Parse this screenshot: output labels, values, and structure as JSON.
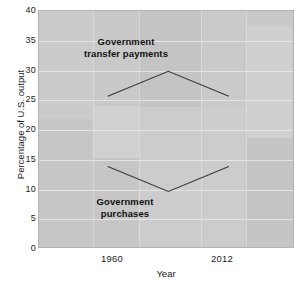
{
  "chart_data": {
    "type": "line",
    "title": "",
    "xlabel": "Year",
    "ylabel": "Percentage of U.S. output",
    "xlim": [
      1930,
      2040
    ],
    "ylim": [
      0,
      40
    ],
    "ytick_labels": [
      "0",
      "5",
      "10",
      "15",
      "20",
      "25",
      "30",
      "35",
      "40"
    ],
    "ytick_values": [
      0,
      5,
      10,
      15,
      20,
      25,
      30,
      35,
      40
    ],
    "xtick_labels": [
      "1960",
      "2012"
    ],
    "xtick_values": [
      1960,
      2012
    ],
    "grid": "horizontal",
    "legend": "none",
    "series": [
      {
        "name": "Government transfer payments",
        "x": [
          1960,
          1986,
          2012
        ],
        "values": [
          25.5,
          29.7,
          25.5
        ],
        "color": "#3a3a3a"
      },
      {
        "name": "Government purchases",
        "x": [
          1960,
          1986,
          2012
        ],
        "values": [
          13.7,
          9.5,
          13.7
        ],
        "color": "#3a3a3a"
      }
    ],
    "annotations": [
      {
        "text_line1": "Government",
        "text_line2": "transfer payments"
      },
      {
        "text_line1": "Government",
        "text_line2": "purchases"
      }
    ],
    "colors": {
      "plot_background": "#c9c9c9",
      "gridline": "#e4e4e4",
      "line": "#3a3a3a",
      "text": "#1a1a1a"
    }
  }
}
